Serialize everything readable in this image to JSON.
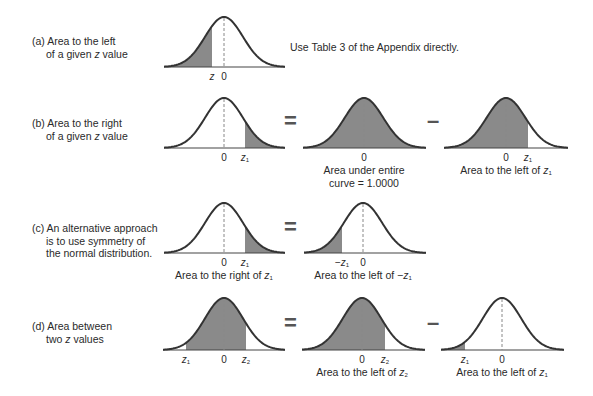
{
  "colors": {
    "shade": "#8a8a8a",
    "stroke": "#333333",
    "dash": "#888888",
    "axis": "#444444"
  },
  "rows": [
    {
      "id": "a",
      "label_lines": [
        "(a) Area to the left",
        "of a given z value"
      ],
      "label_pos": [
        32,
        35
      ],
      "note": "Use Table 3 of the Appendix directly.",
      "note_pos": [
        290,
        41
      ],
      "curves": [
        {
          "x0": 164,
          "x1": 285,
          "mu": 224,
          "top": 17,
          "base": 67,
          "shade": [
            [
              164,
              212
            ]
          ],
          "ticks": [
            {
              "x": 212,
              "text": "z",
              "italic": true
            },
            {
              "x": 224,
              "text": "0"
            }
          ],
          "caption": []
        }
      ],
      "ops": []
    },
    {
      "id": "b",
      "label_lines": [
        "(b) Area to the right",
        "of a given z value"
      ],
      "label_pos": [
        32,
        117
      ],
      "curves": [
        {
          "x0": 164,
          "x1": 285,
          "mu": 224,
          "top": 98,
          "base": 148,
          "shade": [
            [
              245,
              285
            ]
          ],
          "ticks": [
            {
              "x": 224,
              "text": "0"
            },
            {
              "x": 245,
              "text": "z",
              "sub": "1",
              "italic": true
            }
          ],
          "caption": []
        },
        {
          "x0": 303,
          "x1": 426,
          "mu": 364,
          "top": 98,
          "base": 148,
          "shade": [
            [
              303,
              426
            ]
          ],
          "ticks": [
            {
              "x": 364,
              "text": "0"
            }
          ],
          "caption": [
            "Area under entire",
            "curve = 1.0000"
          ]
        },
        {
          "x0": 444,
          "x1": 568,
          "mu": 506,
          "top": 98,
          "base": 148,
          "shade": [
            [
              444,
              528
            ]
          ],
          "ticks": [
            {
              "x": 506,
              "text": "0"
            },
            {
              "x": 528,
              "text": "z",
              "sub": "1",
              "italic": true
            }
          ],
          "caption": [
            "Area to the left of z1"
          ]
        }
      ],
      "ops": [
        {
          "x": 284,
          "y": 111,
          "text": "="
        },
        {
          "x": 427,
          "y": 111,
          "text": "–"
        }
      ]
    },
    {
      "id": "c",
      "label_lines": [
        "(c) An alternative approach",
        "is to use symmetry of",
        "the normal distribution."
      ],
      "label_pos": [
        32,
        222
      ],
      "curves": [
        {
          "x0": 164,
          "x1": 285,
          "mu": 224,
          "top": 203,
          "base": 253,
          "shade": [
            [
              245,
              285
            ]
          ],
          "ticks": [
            {
              "x": 224,
              "text": "0"
            },
            {
              "x": 245,
              "text": "z",
              "sub": "1",
              "italic": true
            }
          ],
          "caption": [
            "Area to the right of z1"
          ]
        },
        {
          "x0": 304,
          "x1": 426,
          "mu": 363,
          "top": 203,
          "base": 253,
          "shade": [
            [
              304,
              342
            ]
          ],
          "ticks": [
            {
              "x": 342,
              "text": "−z",
              "sub": "1",
              "italic": true
            },
            {
              "x": 363,
              "text": "0"
            }
          ],
          "caption": [
            "Area to the left of −z1"
          ]
        }
      ],
      "ops": [
        {
          "x": 284,
          "y": 217,
          "text": "="
        }
      ]
    },
    {
      "id": "d",
      "label_lines": [
        "(d) Area between",
        "two z values"
      ],
      "label_pos": [
        32,
        320
      ],
      "curves": [
        {
          "x0": 163,
          "x1": 285,
          "mu": 224,
          "top": 298,
          "base": 350,
          "shade": [
            [
              186,
              246
            ]
          ],
          "ticks": [
            {
              "x": 186,
              "text": "z",
              "sub": "1",
              "italic": true
            },
            {
              "x": 224,
              "text": "0"
            },
            {
              "x": 246,
              "text": "z",
              "sub": "2",
              "italic": true
            }
          ],
          "caption": []
        },
        {
          "x0": 302,
          "x1": 425,
          "mu": 362,
          "top": 298,
          "base": 350,
          "shade": [
            [
              302,
              385
            ]
          ],
          "ticks": [
            {
              "x": 362,
              "text": "0"
            },
            {
              "x": 385,
              "text": "z",
              "sub": "2",
              "italic": true
            }
          ],
          "caption": [
            "Area to the left of z2"
          ]
        },
        {
          "x0": 441,
          "x1": 564,
          "mu": 502,
          "top": 298,
          "base": 350,
          "shade": [
            [
              441,
              465
            ]
          ],
          "ticks": [
            {
              "x": 465,
              "text": "z",
              "sub": "1",
              "italic": true
            },
            {
              "x": 502,
              "text": "0"
            }
          ],
          "caption": [
            "Area to the left of z1"
          ]
        }
      ],
      "ops": [
        {
          "x": 284,
          "y": 313,
          "text": "="
        },
        {
          "x": 427,
          "y": 313,
          "text": "–"
        }
      ]
    }
  ]
}
